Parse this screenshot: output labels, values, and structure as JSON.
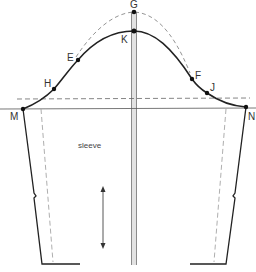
{
  "diagram": {
    "pattern_label": "sleeve",
    "colors": {
      "outline": "#222222",
      "guide": "#555555",
      "dashed": "#888888",
      "center_band_fill": "#d9d9d9",
      "center_band_line": "#888888",
      "text": "#333333"
    },
    "points": [
      {
        "id": "G",
        "label": "G",
        "x": 134,
        "y": 12,
        "label_x": 130,
        "label_y": 8
      },
      {
        "id": "K",
        "label": "K",
        "x": 134,
        "y": 31,
        "label_x": 121,
        "label_y": 43
      },
      {
        "id": "E",
        "label": "E",
        "x": 78,
        "y": 60,
        "label_x": 67,
        "label_y": 61
      },
      {
        "id": "H",
        "label": "H",
        "x": 54,
        "y": 89,
        "label_x": 44,
        "label_y": 87
      },
      {
        "id": "M",
        "label": "M",
        "x": 23,
        "y": 109,
        "label_x": 10,
        "label_y": 120
      },
      {
        "id": "F",
        "label": "F",
        "x": 192,
        "y": 79,
        "label_x": 195,
        "label_y": 79
      },
      {
        "id": "J",
        "label": "J",
        "x": 207,
        "y": 93,
        "label_x": 210,
        "label_y": 91
      },
      {
        "id": "N",
        "label": "N",
        "x": 246,
        "y": 107,
        "label_x": 248,
        "label_y": 120
      }
    ],
    "grainline": {
      "x": 103,
      "y1": 187,
      "y2": 248
    }
  }
}
